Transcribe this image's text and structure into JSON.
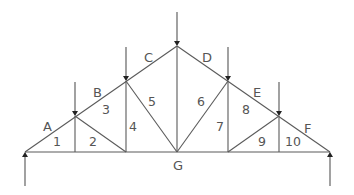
{
  "diagram": {
    "type": "truss",
    "colors": {
      "line": "#5a5a5a",
      "text": "#555555",
      "background": "#ffffff"
    },
    "nodes": {
      "left_support": [
        25,
        152
      ],
      "top_1": [
        75,
        116
      ],
      "top_2": [
        126,
        81
      ],
      "apex": [
        177,
        46
      ],
      "top_4": [
        228,
        81
      ],
      "top_5": [
        279,
        116
      ],
      "right_support": [
        330,
        152
      ],
      "bottom_1": [
        75,
        152
      ],
      "bottom_2": [
        126,
        152
      ],
      "bottom_3": [
        177,
        152
      ],
      "bottom_4": [
        228,
        152
      ],
      "bottom_5": [
        279,
        152
      ]
    },
    "external_space_labels": [
      {
        "text": "A",
        "x": 43,
        "y": 131
      },
      {
        "text": "B",
        "x": 93,
        "y": 97
      },
      {
        "text": "C",
        "x": 144,
        "y": 62
      },
      {
        "text": "D",
        "x": 202,
        "y": 62
      },
      {
        "text": "E",
        "x": 253,
        "y": 97
      },
      {
        "text": "F",
        "x": 304,
        "y": 133
      },
      {
        "text": "G",
        "x": 173,
        "y": 170
      }
    ],
    "panel_labels": [
      {
        "text": "1",
        "x": 53,
        "y": 146
      },
      {
        "text": "2",
        "x": 89,
        "y": 146
      },
      {
        "text": "3",
        "x": 102,
        "y": 114
      },
      {
        "text": "4",
        "x": 129,
        "y": 131
      },
      {
        "text": "5",
        "x": 148,
        "y": 106
      },
      {
        "text": "6",
        "x": 197,
        "y": 106
      },
      {
        "text": "7",
        "x": 216,
        "y": 131
      },
      {
        "text": "8",
        "x": 242,
        "y": 114
      },
      {
        "text": "9",
        "x": 258,
        "y": 146
      },
      {
        "text": "10",
        "x": 285,
        "y": 146
      }
    ],
    "loads": {
      "downward": [
        "top_1",
        "top_2",
        "apex",
        "top_4",
        "top_5"
      ],
      "upward_reactions": [
        "left_support",
        "right_support"
      ]
    }
  }
}
